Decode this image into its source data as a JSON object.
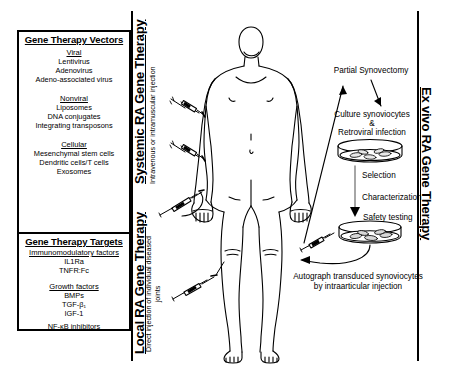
{
  "left_panel": {
    "vectors": {
      "title": "Gene Therapy Vectors",
      "groups": [
        {
          "subtitle": "Viral",
          "items": [
            "Lentivirus",
            "Adenovirus",
            "Adeno-associated virus"
          ]
        },
        {
          "subtitle": "Nonviral",
          "items": [
            "Liposomes",
            "DNA conjugates",
            "Integrating transposons"
          ]
        },
        {
          "subtitle": "Cellular",
          "items": [
            "Mesenchymal stem cells",
            "Dendritic cells/T cells",
            "Exosomes"
          ]
        }
      ]
    },
    "targets": {
      "title": "Gene Therapy Targets",
      "groups": [
        {
          "subtitle": "Immunomodulatory factors",
          "items": [
            "IL1Ra",
            "TNFR:Fc"
          ]
        },
        {
          "subtitle": "Growth factors",
          "items": [
            "BMPs",
            "TGF-β₁",
            "IGF-1"
          ]
        }
      ],
      "footer": "NF-κB inhibitors"
    }
  },
  "vertical_labels": {
    "systemic_title": "Systemic RA Gene Therapy",
    "systemic_sub": "Intravenous or intramuscular injection",
    "local_title": "Local RA Gene Therapy",
    "local_sub": "Direct injection of individual diseased joints",
    "exvivo_title": "Ex vivo RA Gene Therapy"
  },
  "workflow": {
    "steps": [
      {
        "id": "partial-synovectomy",
        "label": "Partial Synovectomy"
      },
      {
        "id": "culture-synoviocytes",
        "label": "Culture synoviocytes"
      },
      {
        "id": "ampersand",
        "label": "&"
      },
      {
        "id": "retroviral-infection",
        "label": "Retroviral infection"
      },
      {
        "id": "selection",
        "label": "Selection"
      },
      {
        "id": "characterization",
        "label": "Characterization"
      },
      {
        "id": "safety-testing",
        "label": "Safety testing"
      }
    ],
    "final_line1": "Autograph transduced synoviocytes",
    "final_line2": "by intraarticular injection"
  },
  "icons": {
    "syringe": "syringe-icon",
    "petri_dish": "petri-dish-icon",
    "human_body": "human-body-figure",
    "arrow": "arrow-icon"
  },
  "colors": {
    "stroke": "#000000",
    "background": "#ffffff",
    "fill_light": "#f2f2f2"
  }
}
